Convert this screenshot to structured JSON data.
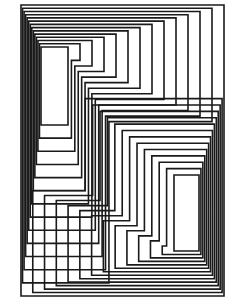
{
  "artwork": {
    "description": "Op-art line drawing of nested rectilinear outlines around two tall rectangles",
    "background": "#ffffff",
    "stroke": "#1a1a1a",
    "stroke_width": 1.6,
    "canvas": {
      "width": 237,
      "height": 304
    },
    "outer_frame": {
      "x": 21,
      "y": 5,
      "w": 203,
      "h": 291
    },
    "left_rect": {
      "x": 41,
      "y": 47,
      "w": 27,
      "h": 78
    },
    "right_rect": {
      "x": 174,
      "y": 175,
      "w": 25,
      "h": 76
    },
    "ring_count": 12,
    "ring_spacing": 4.2
  }
}
